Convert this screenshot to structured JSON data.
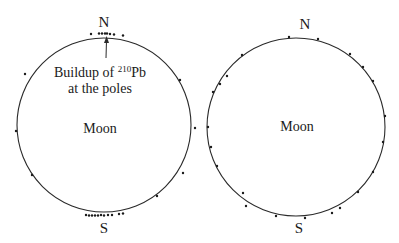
{
  "left_panel": {
    "north_label": "N",
    "south_label": "S",
    "body_label": "Moon",
    "annotation_line1_prefix": "Buildup of ",
    "annotation_superscript": "210",
    "annotation_line1_suffix": "Pb",
    "annotation_line2": "at the poles",
    "circle": {
      "cx": 104,
      "cy": 125,
      "r": 87
    },
    "dots": [
      [
        91,
        34
      ],
      [
        99,
        33.5
      ],
      [
        102,
        33.5
      ],
      [
        105,
        33.5
      ],
      [
        107,
        33.5
      ],
      [
        110,
        34
      ],
      [
        114,
        34.5
      ],
      [
        123,
        35.5
      ],
      [
        86,
        215
      ],
      [
        89,
        215.5
      ],
      [
        92,
        215.5
      ],
      [
        95,
        215.5
      ],
      [
        98,
        215.5
      ],
      [
        101,
        215
      ],
      [
        104,
        215.5
      ],
      [
        108,
        215
      ],
      [
        112,
        215
      ],
      [
        119,
        214
      ],
      [
        123,
        213.5
      ],
      [
        25,
        74
      ],
      [
        180,
        80
      ],
      [
        16,
        131
      ],
      [
        195,
        128
      ],
      [
        32,
        175
      ],
      [
        183,
        173
      ],
      [
        157,
        196
      ]
    ]
  },
  "right_panel": {
    "north_label": "N",
    "south_label": "S",
    "body_label": "Moon",
    "circle": {
      "cx": 296,
      "cy": 127,
      "r": 89
    },
    "dots": [
      [
        289,
        37
      ],
      [
        318,
        39
      ],
      [
        350,
        54
      ],
      [
        363,
        67
      ],
      [
        373,
        81
      ],
      [
        385,
        116
      ],
      [
        383,
        142
      ],
      [
        373,
        172
      ],
      [
        358,
        192
      ],
      [
        340,
        208
      ],
      [
        332,
        213
      ],
      [
        305,
        218
      ],
      [
        276,
        216
      ],
      [
        243,
        193
      ],
      [
        246,
        206
      ],
      [
        217,
        166
      ],
      [
        211,
        147
      ],
      [
        208,
        127
      ],
      [
        227,
        76
      ],
      [
        220,
        84
      ],
      [
        213,
        92
      ],
      [
        242,
        55
      ]
    ]
  },
  "colors": {
    "stroke": "#2a2a2a",
    "dot": "#1a1a1a",
    "text": "#1a1a1a",
    "background": "#ffffff"
  }
}
